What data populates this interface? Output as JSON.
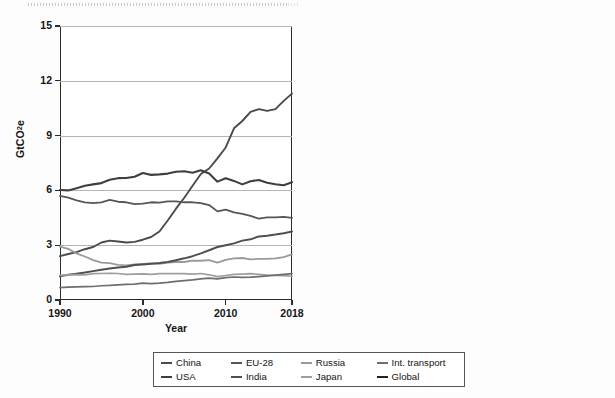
{
  "figure": {
    "background": "#fdfdfd",
    "panel_count": 2
  },
  "legend": {
    "row1": [
      {
        "label": "China",
        "color": "#4a4a4a"
      },
      {
        "label": "EU-28",
        "color": "#565656"
      },
      {
        "label": "Russia",
        "color": "#9a9a9a"
      },
      {
        "label": "Int. transport",
        "color": "#6e6e6e"
      }
    ],
    "row2": [
      {
        "label": "USA",
        "color": "#3f3f3f"
      },
      {
        "label": "India",
        "color": "#4f4f4f"
      },
      {
        "label": "Japan",
        "color": "#9e9e9e"
      },
      {
        "label": "Global",
        "color": "#222222"
      }
    ]
  },
  "chart_data": [
    {
      "type": "line",
      "title": "",
      "xlabel": "Year",
      "ylabel": "GtCO2e",
      "ylabel_display": "GtCO₂e",
      "xlim": [
        1990,
        2018
      ],
      "ylim": [
        0,
        15
      ],
      "yticks": [
        0,
        3,
        6,
        9,
        12,
        15
      ],
      "xticks": [
        1990,
        2000,
        2010,
        2018
      ],
      "grid": "horizontal",
      "legend_position": "below-figure-shared",
      "x": [
        1990,
        1991,
        1992,
        1993,
        1994,
        1995,
        1996,
        1997,
        1998,
        1999,
        2000,
        2001,
        2002,
        2003,
        2004,
        2005,
        2006,
        2007,
        2008,
        2009,
        2010,
        2011,
        2012,
        2013,
        2014,
        2015,
        2016,
        2017,
        2018
      ],
      "series": [
        {
          "name": "China",
          "color": "#4a4a4a",
          "width": 1.9,
          "values": [
            2.4,
            2.52,
            2.62,
            2.78,
            2.9,
            3.15,
            3.25,
            3.2,
            3.15,
            3.18,
            3.3,
            3.45,
            3.75,
            4.35,
            5.0,
            5.6,
            6.25,
            6.9,
            7.2,
            7.75,
            8.35,
            9.4,
            9.8,
            10.3,
            10.45,
            10.35,
            10.45,
            10.9,
            11.3
          ]
        },
        {
          "name": "USA",
          "color": "#3f3f3f",
          "width": 2.1,
          "values": [
            6.02,
            6.0,
            6.12,
            6.25,
            6.33,
            6.4,
            6.58,
            6.67,
            6.68,
            6.75,
            6.95,
            6.85,
            6.88,
            6.92,
            7.02,
            7.05,
            6.97,
            7.1,
            6.92,
            6.48,
            6.67,
            6.52,
            6.33,
            6.5,
            6.57,
            6.42,
            6.34,
            6.28,
            6.45
          ]
        },
        {
          "name": "EU-28",
          "color": "#565656",
          "width": 1.8,
          "values": [
            5.7,
            5.6,
            5.45,
            5.35,
            5.3,
            5.35,
            5.48,
            5.38,
            5.35,
            5.25,
            5.28,
            5.35,
            5.33,
            5.4,
            5.4,
            5.35,
            5.35,
            5.3,
            5.2,
            4.85,
            4.95,
            4.8,
            4.72,
            4.6,
            4.45,
            4.52,
            4.52,
            4.55,
            4.5
          ]
        },
        {
          "name": "Russia",
          "color": "#9a9a9a",
          "width": 1.8,
          "values": [
            2.92,
            2.8,
            2.55,
            2.38,
            2.18,
            2.05,
            2.02,
            1.92,
            1.9,
            1.95,
            1.98,
            2.0,
            1.98,
            2.05,
            2.08,
            2.08,
            2.15,
            2.15,
            2.18,
            2.05,
            2.2,
            2.28,
            2.3,
            2.22,
            2.25,
            2.25,
            2.28,
            2.35,
            2.5
          ]
        },
        {
          "name": "India",
          "color": "#4f4f4f",
          "width": 2.0,
          "values": [
            1.3,
            1.38,
            1.44,
            1.5,
            1.58,
            1.66,
            1.72,
            1.78,
            1.82,
            1.92,
            1.95,
            1.98,
            2.02,
            2.08,
            2.18,
            2.28,
            2.4,
            2.55,
            2.72,
            2.9,
            3.0,
            3.1,
            3.25,
            3.32,
            3.48,
            3.52,
            3.58,
            3.65,
            3.75
          ]
        },
        {
          "name": "Japan",
          "color": "#9e9e9e",
          "width": 1.7,
          "values": [
            1.35,
            1.38,
            1.39,
            1.38,
            1.44,
            1.45,
            1.46,
            1.45,
            1.4,
            1.42,
            1.43,
            1.4,
            1.44,
            1.45,
            1.44,
            1.44,
            1.42,
            1.45,
            1.38,
            1.28,
            1.34,
            1.4,
            1.42,
            1.44,
            1.4,
            1.36,
            1.34,
            1.33,
            1.3
          ]
        },
        {
          "name": "Int. transport",
          "color": "#6e6e6e",
          "width": 1.7,
          "values": [
            0.68,
            0.7,
            0.72,
            0.73,
            0.74,
            0.78,
            0.8,
            0.83,
            0.85,
            0.87,
            0.92,
            0.9,
            0.92,
            0.96,
            1.02,
            1.06,
            1.1,
            1.16,
            1.2,
            1.16,
            1.22,
            1.26,
            1.24,
            1.25,
            1.28,
            1.32,
            1.36,
            1.4,
            1.44
          ]
        }
      ]
    },
    {
      "type": "line",
      "title": "",
      "xlabel": "Year",
      "ylabel": "tCO2e per capita",
      "ylabel_display": "tCO₂e per capita",
      "xlim": [
        1990,
        2018
      ],
      "ylim": [
        0,
        25
      ],
      "yticks": [
        0,
        5,
        10,
        15,
        20,
        25
      ],
      "xticks": [
        1990,
        2000,
        2010,
        2018
      ],
      "grid": "horizontal",
      "legend_position": "below-figure-shared",
      "x": [
        1990,
        1991,
        1992,
        1993,
        1994,
        1995,
        1996,
        1997,
        1998,
        1999,
        2000,
        2001,
        2002,
        2003,
        2004,
        2005,
        2006,
        2007,
        2008,
        2009,
        2010,
        2011,
        2012,
        2013,
        2014,
        2015,
        2016,
        2017,
        2018
      ],
      "series": [
        {
          "name": "USA",
          "color": "#222222",
          "width": 2.4,
          "values": [
            24.05,
            23.55,
            23.7,
            23.9,
            24.0,
            24.05,
            24.55,
            24.45,
            24.85,
            24.4,
            24.8,
            23.9,
            23.85,
            23.75,
            23.9,
            23.85,
            23.35,
            23.55,
            22.6,
            21.2,
            21.9,
            20.9,
            20.55,
            20.95,
            21.05,
            20.35,
            20.2,
            20.05,
            20.35
          ]
        },
        {
          "name": "Russia",
          "color": "#9a9a9a",
          "width": 1.9,
          "values": [
            20.2,
            19.6,
            17.6,
            14.8,
            13.9,
            13.1,
            12.4,
            13.25,
            13.55,
            13.75,
            13.9,
            13.95,
            13.5,
            14.95,
            14.55,
            14.9,
            15.15,
            15.2,
            14.2,
            14.95,
            15.8,
            15.85,
            15.8,
            15.5,
            15.4,
            15.35,
            15.5,
            15.9,
            16.6
          ]
        },
        {
          "name": "EU-28",
          "color": "#565656",
          "width": 1.8,
          "values": [
            12.0,
            11.7,
            11.25,
            11.0,
            10.85,
            10.95,
            11.15,
            10.9,
            10.8,
            10.55,
            10.6,
            10.7,
            10.65,
            10.75,
            10.7,
            10.55,
            10.5,
            10.35,
            10.1,
            9.35,
            9.6,
            9.25,
            9.05,
            8.85,
            8.5,
            8.6,
            8.6,
            8.65,
            8.9
          ]
        },
        {
          "name": "Japan",
          "color": "#9e9e9e",
          "width": 1.7,
          "values": [
            10.3,
            10.42,
            10.45,
            10.4,
            10.8,
            10.9,
            10.95,
            10.8,
            10.45,
            10.65,
            10.7,
            10.45,
            10.75,
            10.82,
            10.78,
            10.78,
            10.62,
            10.85,
            10.3,
            9.65,
            10.15,
            10.95,
            11.15,
            11.3,
            10.95,
            10.8,
            10.85,
            10.88,
            10.85
          ]
        },
        {
          "name": "China",
          "color": "#4a4a4a",
          "width": 1.9,
          "values": [
            3.38,
            3.52,
            3.64,
            3.82,
            3.95,
            4.05,
            4.08,
            4.02,
            3.95,
            3.98,
            4.1,
            4.28,
            4.62,
            5.32,
            6.08,
            6.78,
            7.52,
            8.24,
            8.55,
            9.15,
            9.08,
            9.0,
            9.15,
            9.35,
            9.25,
            9.2,
            9.25,
            9.4,
            9.55
          ]
        },
        {
          "name": "India",
          "color": "#4f4f4f",
          "width": 1.9,
          "values": [
            1.56,
            1.6,
            1.62,
            1.66,
            1.7,
            1.74,
            1.76,
            1.78,
            1.8,
            1.85,
            1.86,
            1.86,
            1.88,
            1.9,
            1.94,
            2.0,
            2.06,
            2.14,
            2.25,
            2.38,
            2.42,
            2.46,
            2.54,
            2.58,
            2.66,
            2.68,
            2.7,
            2.74,
            2.82
          ]
        },
        {
          "name": "Global",
          "color": "#3f3f3f",
          "width": 2.2,
          "values": [
            5.72,
            5.7,
            5.62,
            5.55,
            5.5,
            5.52,
            5.55,
            5.55,
            5.48,
            5.45,
            5.48,
            5.45,
            5.5,
            5.62,
            5.8,
            5.92,
            6.02,
            6.12,
            6.18,
            6.08,
            6.25,
            6.35,
            6.38,
            6.42,
            6.48,
            6.42,
            6.42,
            6.45,
            6.52
          ]
        }
      ]
    }
  ]
}
